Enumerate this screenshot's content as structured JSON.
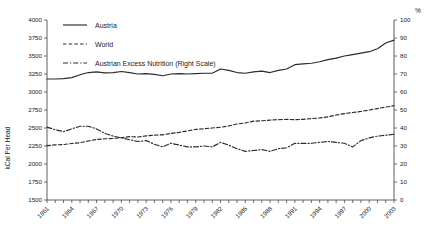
{
  "chart_data": {
    "type": "line",
    "title": "",
    "xlabel": "",
    "ylabel": "kCal Per Head",
    "y2label": "%",
    "ylim": [
      1500,
      4000
    ],
    "y2lim": [
      0,
      100
    ],
    "grid": false,
    "legend_position": "top-left-inside",
    "x": [
      1961,
      1962,
      1963,
      1964,
      1965,
      1966,
      1967,
      1968,
      1969,
      1970,
      1971,
      1972,
      1973,
      1974,
      1975,
      1976,
      1977,
      1978,
      1979,
      1980,
      1981,
      1982,
      1983,
      1984,
      1985,
      1986,
      1987,
      1988,
      1989,
      1990,
      1991,
      1992,
      1993,
      1994,
      1995,
      1996,
      1997,
      1998,
      1999,
      2000,
      2001,
      2002,
      2003
    ],
    "xticks": [
      "1961",
      "1964",
      "1967",
      "1970",
      "1973",
      "1976",
      "1979",
      "1982",
      "1985",
      "1988",
      "1991",
      "1994",
      "1997",
      "2000",
      "2003"
    ],
    "yticks": [
      "1500",
      "1750",
      "2000",
      "2250",
      "2500",
      "2750",
      "3000",
      "3250",
      "3500",
      "3750",
      "4000"
    ],
    "y2ticks": [
      "0",
      "10",
      "20",
      "30",
      "40",
      "50",
      "60",
      "70",
      "80",
      "90",
      "100"
    ],
    "series": [
      {
        "name": "Austria",
        "style": "solid",
        "axis": "left",
        "color": "#2b2b2b",
        "values": [
          3180,
          3180,
          3185,
          3200,
          3240,
          3270,
          3280,
          3265,
          3270,
          3285,
          3270,
          3250,
          3255,
          3245,
          3225,
          3250,
          3255,
          3250,
          3255,
          3260,
          3260,
          3320,
          3300,
          3270,
          3260,
          3280,
          3290,
          3270,
          3300,
          3320,
          3380,
          3390,
          3400,
          3420,
          3450,
          3470,
          3500,
          3520,
          3540,
          3560,
          3600,
          3680,
          3720
        ]
      },
      {
        "name": "World",
        "style": "dashed",
        "axis": "left",
        "color": "#2b2b2b",
        "values": [
          2255,
          2265,
          2270,
          2285,
          2295,
          2320,
          2340,
          2350,
          2355,
          2365,
          2380,
          2375,
          2390,
          2400,
          2405,
          2425,
          2440,
          2460,
          2480,
          2490,
          2500,
          2510,
          2530,
          2555,
          2570,
          2595,
          2600,
          2610,
          2615,
          2620,
          2615,
          2620,
          2630,
          2640,
          2655,
          2680,
          2700,
          2715,
          2730,
          2750,
          2770,
          2790,
          2810
        ]
      },
      {
        "name": "Austrian Excess Nutrition (Right Scale)",
        "style": "dashdot",
        "axis": "right",
        "color": "#2b2b2b",
        "values": [
          40.5,
          39.0,
          38.0,
          39.5,
          41.0,
          41.0,
          39.5,
          37.0,
          35.5,
          34.5,
          33.5,
          32.5,
          33.0,
          31.0,
          29.5,
          31.5,
          30.5,
          29.5,
          29.5,
          30.0,
          29.5,
          32.0,
          30.5,
          28.5,
          27.0,
          27.5,
          28.0,
          27.0,
          28.5,
          29.0,
          31.5,
          31.5,
          31.5,
          32.0,
          32.5,
          32.0,
          31.5,
          29.5,
          33.0,
          34.5,
          35.5,
          36.0,
          36.5
        ]
      }
    ]
  },
  "legend": {
    "items": [
      {
        "label": "Austria",
        "style": "solid"
      },
      {
        "label": "World",
        "style": "dashed"
      },
      {
        "label": "Austrian Excess Nutrition (Right Scale)",
        "style": "dashdot"
      }
    ]
  }
}
